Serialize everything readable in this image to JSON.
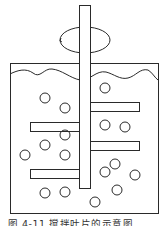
{
  "figure": {
    "caption": "图 4-11  搅拌叶片的示意图",
    "colors": {
      "stroke": "#2a2a2a",
      "background": "#ffffff"
    }
  },
  "diagram": {
    "type": "stirred-tank",
    "shaft": {
      "x": 79,
      "y": 5,
      "w": 11,
      "h": 183
    },
    "rotation_arrow": {
      "cx": 85,
      "cy": 40,
      "rx": 25,
      "ry": 13
    },
    "tank": {
      "x": 10,
      "y": 63,
      "w": 148,
      "h": 150
    },
    "blades": [
      {
        "side": "left",
        "x": 30,
        "y": 122,
        "w": 49,
        "h": 9
      },
      {
        "side": "right",
        "x": 90,
        "y": 141,
        "w": 49,
        "h": 9
      },
      {
        "side": "left",
        "x": 30,
        "y": 169,
        "w": 49,
        "h": 9
      },
      {
        "side": "right",
        "x": 90,
        "y": 102,
        "w": 49,
        "h": 9
      }
    ],
    "particles": [
      [
        45,
        98
      ],
      [
        65,
        108
      ],
      [
        105,
        88
      ],
      [
        105,
        125
      ],
      [
        125,
        127
      ],
      [
        65,
        135
      ],
      [
        45,
        145
      ],
      [
        25,
        155
      ],
      [
        65,
        155
      ],
      [
        115,
        164
      ],
      [
        105,
        172
      ],
      [
        135,
        175
      ],
      [
        45,
        193
      ],
      [
        65,
        192
      ],
      [
        117,
        190
      ],
      [
        95,
        202
      ]
    ]
  }
}
